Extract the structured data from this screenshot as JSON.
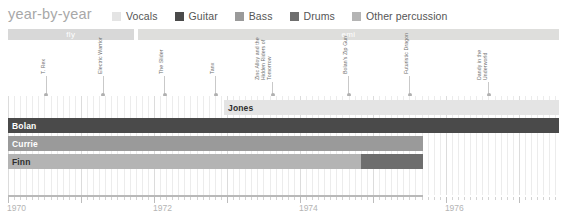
{
  "header": {
    "title": "year-by-year",
    "legend": [
      {
        "label": "Vocals",
        "color": "#e4e4e4"
      },
      {
        "label": "Guitar",
        "color": "#4a4a4a"
      },
      {
        "label": "Bass",
        "color": "#9a9a9a"
      },
      {
        "label": "Drums",
        "color": "#6e6e6e"
      },
      {
        "label": "Other percussion",
        "color": "#b4b4b4"
      }
    ]
  },
  "bands": [
    {
      "name": "fly",
      "label": "fly",
      "start": 1970.0,
      "end": 1971.72,
      "color": "#d8d8d8"
    },
    {
      "name": "emi",
      "label": "emi",
      "start": 1971.78,
      "end": 1977.55,
      "color": "#dededc"
    }
  ],
  "annotations": [
    {
      "label": "T. Rex",
      "year": 1970.52,
      "lines": 1
    },
    {
      "label": "Electric Warrior",
      "year": 1971.3,
      "lines": 1
    },
    {
      "label": "The Slider",
      "year": 1972.14,
      "lines": 1
    },
    {
      "label": "Tanx",
      "year": 1972.84,
      "lines": 1
    },
    {
      "label": "Zinc Alloy and the Hidden Riders of Tomorrow",
      "year": 1973.62,
      "lines": 2
    },
    {
      "label": "Bolan's Zip Gun",
      "year": 1974.66,
      "lines": 1
    },
    {
      "label": "Futuristic Dragon",
      "year": 1975.5,
      "lines": 1
    },
    {
      "label": "Dandy in the Underworld",
      "year": 1976.58,
      "lines": 2
    }
  ],
  "chart_data": {
    "type": "bar",
    "title": "year-by-year",
    "xlabel": "",
    "ylabel": "",
    "xlim": [
      1970.0,
      1977.55
    ],
    "grid": true,
    "legend_position": "top",
    "tick_labels": [
      "1970",
      "1972",
      "1974",
      "1976"
    ],
    "tick_years": [
      1970,
      1972,
      1974,
      1976
    ],
    "categories": [
      "Jones",
      "Bolan",
      "Currie",
      "Legend",
      "Lutton",
      "Finn"
    ],
    "series": [
      {
        "name": "Vocals",
        "color": "#e4e4e4",
        "bars": [
          {
            "member": "Jones",
            "row": 0,
            "start": 1972.96,
            "end": 1977.55
          }
        ]
      },
      {
        "name": "Guitar",
        "color": "#4a4a4a",
        "bars": [
          {
            "member": "Bolan",
            "row": 1,
            "start": 1970.0,
            "end": 1977.55
          }
        ]
      },
      {
        "name": "Bass",
        "color": "#9a9a9a",
        "bars": [
          {
            "member": "Currie",
            "row": 2,
            "start": 1970.0,
            "end": 1975.68
          }
        ]
      },
      {
        "name": "Drums",
        "color": "#6e6e6e",
        "bars": [
          {
            "member": "Legend",
            "row": 3,
            "start": 1970.0,
            "end": 1973.84
          },
          {
            "member": "Lutton",
            "row": 3,
            "start": 1973.84,
            "end": 1975.68
          }
        ]
      },
      {
        "name": "Other percussion",
        "color": "#b4b4b4",
        "bars": [
          {
            "member": "Finn",
            "row": 4,
            "start": 1970.0,
            "end": 1974.84
          }
        ]
      }
    ]
  },
  "axis": {
    "rule_color": "#b9b9b9",
    "rule_start": 1970.0,
    "rule_end": 1975.68
  }
}
